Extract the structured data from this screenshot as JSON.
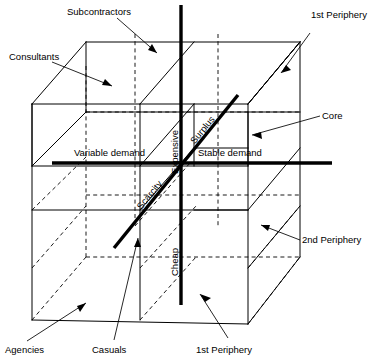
{
  "figure": {
    "type": "3d-cube-diagram",
    "background_color": "#ffffff",
    "line_color": "#000000",
    "axes": {
      "vertical": {
        "name": "price-axis",
        "top_label": "Expensive",
        "bottom_label": "Cheap"
      },
      "horizontal": {
        "name": "demand-axis",
        "left_label": "Variable demand",
        "right_label": "Stable demand"
      },
      "diagonal": {
        "name": "supply-axis",
        "upper_label": "Surplus",
        "lower_label": "Scarcity"
      }
    },
    "callouts": [
      {
        "id": "subcontractors",
        "label": "Subcontractors"
      },
      {
        "id": "first-periphery-top-right",
        "label": "1st Periphery"
      },
      {
        "id": "consultants",
        "label": "Consultants"
      },
      {
        "id": "core",
        "label": "Core"
      },
      {
        "id": "second-periphery",
        "label": "2nd Periphery"
      },
      {
        "id": "agencies",
        "label": "Agencies"
      },
      {
        "id": "casuals",
        "label": "Casuals"
      },
      {
        "id": "first-periphery-bottom",
        "label": "1st Periphery"
      }
    ]
  }
}
